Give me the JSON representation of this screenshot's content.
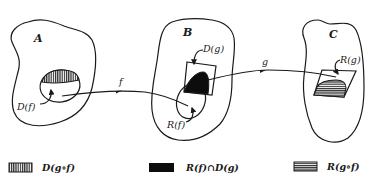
{
  "diagram": {
    "sets": [
      {
        "id": "A",
        "label": "A",
        "subset_label": "D(f)"
      },
      {
        "id": "B",
        "label": "B",
        "subset_labels": [
          "D(g)",
          "R(f)"
        ]
      },
      {
        "id": "C",
        "label": "C",
        "subset_label": "R(g)"
      }
    ],
    "arrows": [
      {
        "label": "f",
        "from": "D(f)",
        "to": "R(f)"
      },
      {
        "label": "g",
        "from": "D(g)",
        "to": "R(g)"
      }
    ],
    "legend": [
      {
        "pattern": "vertical-hatch",
        "label": "D(g∘f)"
      },
      {
        "pattern": "solid-black",
        "label": "R(f)∩D(g)"
      },
      {
        "pattern": "horizontal-hatch",
        "label": "R(g∘f)"
      }
    ]
  },
  "colors": {
    "ink": "#1a1a1a",
    "background": "#ffffff"
  }
}
